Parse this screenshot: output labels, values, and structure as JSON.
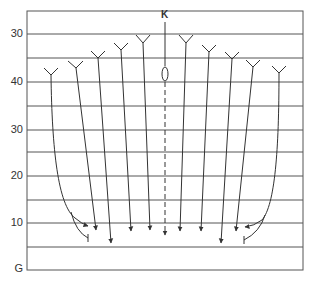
{
  "diagram": {
    "type": "flight-path / ski-jump style diagram",
    "top_label": "K",
    "y_axis_labels": [
      {
        "text": "30",
        "y": 34
      },
      {
        "text": "40",
        "y": 82
      },
      {
        "text": "30",
        "y": 130
      },
      {
        "text": "20",
        "y": 176
      },
      {
        "text": "10",
        "y": 223
      },
      {
        "text": "G",
        "y": 269
      }
    ],
    "colors": {
      "line": "#444444",
      "grid": "#555555",
      "text": "#333333",
      "background": "#ffffff"
    }
  }
}
